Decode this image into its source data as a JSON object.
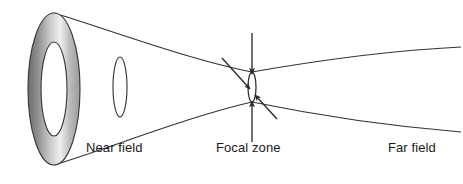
{
  "figure": {
    "kind": "ultrasound-beam-profile-diagram",
    "background_color": "#ffffff",
    "line_color": "#333333",
    "label_color": "#1a1a1a"
  },
  "labels": {
    "near_field": "Near field",
    "focal_zone": "Focal zone",
    "far_field": "Far field"
  },
  "transducer": {
    "name": "annular-transducer",
    "outer_fill_light": "#f2f2f2",
    "outer_fill_mid": "#9a9a9a",
    "outer_fill_dark": "#6e6e6e",
    "inner_fill": "#ffffff",
    "center_x": 54,
    "center_y": 89,
    "outer_rx": 26,
    "outer_ry": 76,
    "inner_rx": 13,
    "inner_ry": 47
  },
  "near_field_aperture": {
    "name": "near-field-waist-ellipse",
    "center_x": 120,
    "center_y": 87,
    "rx": 7,
    "ry": 30
  },
  "focal_zone_aperture": {
    "name": "focal-zone-ellipse",
    "center_x": 252,
    "center_y": 87,
    "rx": 4,
    "ry": 15
  },
  "beam": {
    "upper_converge_start_y": 13,
    "upper_focus_y": 72,
    "lower_converge_start_y": 165,
    "lower_focus_y": 102,
    "upper_far_end_y": 47,
    "lower_far_end_y": 132,
    "focus_x": 252
  },
  "annotations": {
    "vertical_arrow": {
      "name": "focal-width-arrow",
      "x": 252,
      "top_y": 33,
      "bottom_y": 142,
      "meaning": "beam width at focus"
    },
    "diagonal_arrow": {
      "name": "focal-length-arrow",
      "x1": 222,
      "y1": 58,
      "x2": 277,
      "y2": 119,
      "meaning": "focal zone length"
    }
  }
}
